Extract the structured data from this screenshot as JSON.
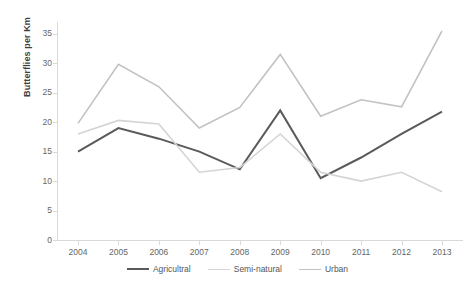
{
  "chart_data": {
    "type": "line",
    "title": "",
    "xlabel": "",
    "ylabel": "Butterflies per Km",
    "categories": [
      "2004",
      "2005",
      "2006",
      "2007",
      "2008",
      "2009",
      "2010",
      "2011",
      "2012",
      "2013"
    ],
    "x_tick_labels": [
      "2004",
      "2005",
      "2006",
      "2007",
      "2008",
      "2009",
      "2010",
      "2011",
      "2012",
      "2013"
    ],
    "y_tick_labels": [
      "0",
      "5",
      "10",
      "15",
      "20",
      "25",
      "30",
      "35"
    ],
    "y_ticks": [
      0,
      5,
      10,
      15,
      20,
      25,
      30,
      35
    ],
    "ylim": [
      0,
      37
    ],
    "xlim": [
      2004,
      2013
    ],
    "grid": false,
    "legend_position": "bottom",
    "series": [
      {
        "name": "Agricultral",
        "color": "#5a5a5a",
        "width": 2.0,
        "values": [
          15.0,
          19.0,
          17.2,
          15.0,
          12.0,
          22.0,
          10.5,
          14.0,
          18.0,
          21.8
        ]
      },
      {
        "name": "Semi-natural",
        "color": "#d4d4d4",
        "width": 1.6,
        "values": [
          18.0,
          20.3,
          19.7,
          11.5,
          12.3,
          18.0,
          11.5,
          10.0,
          11.5,
          8.2
        ]
      },
      {
        "name": "Urban",
        "color": "#c2c2c2",
        "width": 1.6,
        "values": [
          19.8,
          29.8,
          26.0,
          19.0,
          22.5,
          31.5,
          21.0,
          23.8,
          22.6,
          35.5
        ]
      }
    ]
  },
  "axis": {
    "y_title": "Butterflies per Km",
    "axis_line_color": "#d9d9d9",
    "tick_text_color": "#666666"
  },
  "legend": {
    "items": [
      {
        "label": "Agricultral",
        "color": "#5a5a5a",
        "width": 2.0
      },
      {
        "label": "Semi-natural",
        "color": "#d4d4d4",
        "width": 1.6
      },
      {
        "label": "Urban",
        "color": "#c2c2c2",
        "width": 1.6
      }
    ]
  }
}
